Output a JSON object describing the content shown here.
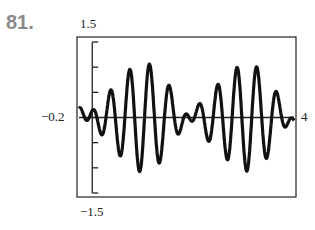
{
  "problem": {
    "number": "81."
  },
  "chart_data": {
    "type": "line",
    "title": "",
    "xlabel": "",
    "ylabel": "",
    "xlim": [
      -0.2,
      4
    ],
    "ylim": [
      -1.5,
      1.5
    ],
    "grid": false,
    "legend": null,
    "axis_labels": {
      "ymax": "1.5",
      "ymin": "−1.5",
      "xmin": "−0.2",
      "xmax": "4"
    },
    "y_ticks": [
      -1.5,
      -1,
      -0.5,
      0,
      0.5,
      1,
      1.5
    ],
    "series": [
      {
        "name": "y",
        "x": [
          -0.2,
          0.0,
          0.34,
          0.53,
          0.72,
          0.9,
          1.0,
          1.1,
          1.29,
          1.48,
          1.67,
          1.86,
          2.06,
          2.25,
          2.44,
          2.63,
          2.82,
          2.92,
          3.02,
          3.2,
          3.4,
          3.6,
          3.78,
          4.0
        ],
        "y": [
          -0.05,
          0.0,
          0.45,
          -0.7,
          0.9,
          -0.95,
          1.02,
          -0.85,
          0.75,
          -0.45,
          0.25,
          0.15,
          0.05,
          0.1,
          -0.45,
          0.7,
          -0.85,
          1.0,
          -1.0,
          0.9,
          -0.65,
          0.45,
          -0.2,
          0.1
        ]
      }
    ]
  }
}
